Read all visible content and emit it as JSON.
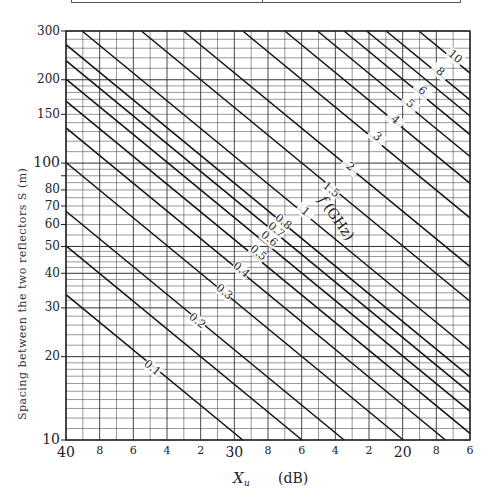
{
  "chart_data": {
    "type": "line",
    "title": "",
    "xlabel": "X_u (dB)",
    "xlabel_symbol": "X",
    "xlabel_sub": "u",
    "xlabel_unit": "(dB)",
    "ylabel": "Spacing between the two reflectors S (m)",
    "x_scale": "linear",
    "x_direction": "decreasing",
    "xlim": [
      40,
      16
    ],
    "y_scale": "log",
    "ylim": [
      10,
      300
    ],
    "grid": true,
    "legend": "inline curve labels",
    "family_label": "f (GHz)",
    "relation": "X_u = 20*log10(S) - 20*log10(f) - 10.5",
    "x_ticks": [
      {
        "value": 40,
        "label": "40",
        "major": true
      },
      {
        "value": 38,
        "label": "8",
        "major": false
      },
      {
        "value": 36,
        "label": "6",
        "major": false
      },
      {
        "value": 34,
        "label": "4",
        "major": false
      },
      {
        "value": 32,
        "label": "2",
        "major": false
      },
      {
        "value": 30,
        "label": "30",
        "major": true
      },
      {
        "value": 28,
        "label": "8",
        "major": false
      },
      {
        "value": 26,
        "label": "6",
        "major": false
      },
      {
        "value": 24,
        "label": "4",
        "major": false
      },
      {
        "value": 22,
        "label": "2",
        "major": false
      },
      {
        "value": 20,
        "label": "20",
        "major": true
      },
      {
        "value": 18,
        "label": "8",
        "major": false
      },
      {
        "value": 16,
        "label": "6",
        "major": false
      }
    ],
    "y_ticks": [
      {
        "value": 10,
        "label": "10",
        "major": true
      },
      {
        "value": 20,
        "label": "20",
        "major": false
      },
      {
        "value": 30,
        "label": "30",
        "major": false
      },
      {
        "value": 40,
        "label": "40",
        "major": false
      },
      {
        "value": 50,
        "label": "50",
        "major": false
      },
      {
        "value": 60,
        "label": "60",
        "major": false
      },
      {
        "value": 70,
        "label": "70",
        "major": false
      },
      {
        "value": 80,
        "label": "80",
        "major": false
      },
      {
        "value": 100,
        "label": "100",
        "major": true
      },
      {
        "value": 150,
        "label": "150",
        "major": false
      },
      {
        "value": 200,
        "label": "200",
        "major": false
      },
      {
        "value": 300,
        "label": "300",
        "major": false
      }
    ],
    "series": [
      {
        "name": "0.1",
        "f_GHz": 0.1,
        "label": "0.1",
        "label_pos": {
          "x": 152,
          "y": 368
        },
        "points": [
          [
            40,
            33
          ],
          [
            29.5,
            10
          ]
        ]
      },
      {
        "name": "0.15",
        "f_GHz": 0.15,
        "label": "",
        "points": [
          [
            40,
            50
          ],
          [
            26,
            10
          ]
        ]
      },
      {
        "name": "0.2",
        "f_GHz": 0.2,
        "label": "0.2",
        "label_pos": {
          "x": 197,
          "y": 321
        },
        "points": [
          [
            40,
            66
          ],
          [
            23.5,
            10
          ]
        ]
      },
      {
        "name": "0.3",
        "f_GHz": 0.3,
        "label": "0.3",
        "label_pos": {
          "x": 224,
          "y": 292
        },
        "points": [
          [
            40,
            99
          ],
          [
            20,
            10
          ]
        ]
      },
      {
        "name": "0.4",
        "f_GHz": 0.4,
        "label": "0.4",
        "label_pos": {
          "x": 241,
          "y": 270
        },
        "points": [
          [
            40,
            132
          ],
          [
            17.5,
            10
          ]
        ]
      },
      {
        "name": "0.5",
        "f_GHz": 0.5,
        "label": "0.5",
        "label_pos": {
          "x": 258,
          "y": 253
        },
        "points": [
          [
            40,
            166
          ],
          [
            16,
            10.5
          ]
        ]
      },
      {
        "name": "0.6",
        "f_GHz": 0.6,
        "label": "0.6",
        "label_pos": {
          "x": 269,
          "y": 239
        },
        "points": [
          [
            40,
            200
          ],
          [
            16,
            12.6
          ]
        ]
      },
      {
        "name": "0.7",
        "f_GHz": 0.7,
        "label": "0.7",
        "label_pos": {
          "x": 276,
          "y": 230
        },
        "points": [
          [
            40,
            232
          ],
          [
            16,
            14.6
          ]
        ]
      },
      {
        "name": "0.8",
        "f_GHz": 0.8,
        "label": "0.8",
        "label_pos": {
          "x": 283,
          "y": 222
        },
        "points": [
          [
            40,
            266
          ],
          [
            16,
            16.8
          ]
        ]
      },
      {
        "name": "1",
        "f_GHz": 1,
        "label": "1",
        "label_pos": {
          "x": 305,
          "y": 212
        },
        "points": [
          [
            39,
            300
          ],
          [
            16,
            21
          ]
        ]
      },
      {
        "name": "1.5",
        "f_GHz": 1.5,
        "label": "1.5",
        "label_pos": {
          "x": 331,
          "y": 190
        },
        "points": [
          [
            35.5,
            300
          ],
          [
            16,
            31.5
          ]
        ]
      },
      {
        "name": "2",
        "f_GHz": 2,
        "label": "2",
        "label_pos": {
          "x": 350,
          "y": 167
        },
        "points": [
          [
            33,
            300
          ],
          [
            16,
            42
          ]
        ]
      },
      {
        "name": "3",
        "f_GHz": 3,
        "label": "3",
        "label_pos": {
          "x": 377,
          "y": 137
        },
        "points": [
          [
            29.5,
            300
          ],
          [
            16,
            63
          ]
        ]
      },
      {
        "name": "4",
        "f_GHz": 4,
        "label": "4",
        "label_pos": {
          "x": 395,
          "y": 120
        },
        "points": [
          [
            27,
            300
          ],
          [
            16,
            84
          ]
        ]
      },
      {
        "name": "5",
        "f_GHz": 5,
        "label": "5",
        "label_pos": {
          "x": 410,
          "y": 104
        },
        "points": [
          [
            25,
            300
          ],
          [
            16,
            105
          ]
        ]
      },
      {
        "name": "6",
        "f_GHz": 6,
        "label": "6",
        "label_pos": {
          "x": 422,
          "y": 91
        },
        "points": [
          [
            23.5,
            300
          ],
          [
            16,
            126
          ]
        ]
      },
      {
        "name": "7",
        "f_GHz": 7,
        "label": "",
        "points": [
          [
            22,
            300
          ],
          [
            16,
            147
          ]
        ]
      },
      {
        "name": "8",
        "f_GHz": 8,
        "label": "8",
        "label_pos": {
          "x": 440,
          "y": 72
        },
        "points": [
          [
            21,
            300
          ],
          [
            16,
            168
          ]
        ]
      },
      {
        "name": "10",
        "f_GHz": 10,
        "label": "10",
        "label_pos": {
          "x": 455,
          "y": 57
        },
        "points": [
          [
            19,
            300
          ],
          [
            16,
            210
          ]
        ]
      }
    ]
  },
  "labels": {
    "family_label_f": "f",
    "family_label_unit": "(GHz)"
  }
}
